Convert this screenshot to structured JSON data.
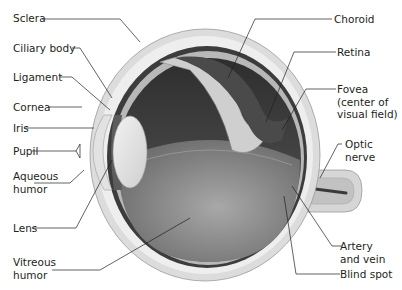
{
  "diagram": {
    "type": "anatomical cross-section",
    "colors": {
      "background": "#ffffff",
      "sclera_outer": "#d9d9d9",
      "sclera_inner": "#eeeeee",
      "choroid": "#3a3a3a",
      "retina": "#bdbdbd",
      "vitreous": "#8c8c8c",
      "lens": "#e6e6e6",
      "leader_line": "#231f20",
      "text": "#231f20"
    },
    "labels_left": [
      {
        "id": "sclera",
        "text": "Sclera"
      },
      {
        "id": "ciliary-body",
        "text": "Ciliary body"
      },
      {
        "id": "ligament",
        "text": "Ligament"
      },
      {
        "id": "cornea",
        "text": "Cornea"
      },
      {
        "id": "iris",
        "text": "Iris"
      },
      {
        "id": "pupil",
        "text": "Pupil"
      },
      {
        "id": "aqueous-humor",
        "text": "Aqueous\nhumor"
      },
      {
        "id": "lens",
        "text": "Lens"
      },
      {
        "id": "vitreous-humor",
        "text": "Vitreous\nhumor"
      }
    ],
    "labels_right": [
      {
        "id": "choroid",
        "text": "Choroid"
      },
      {
        "id": "retina",
        "text": "Retina"
      },
      {
        "id": "fovea",
        "text": "Fovea\n(center of\nvisual field)"
      },
      {
        "id": "optic-nerve",
        "text": "Optic\nnerve"
      },
      {
        "id": "artery-and-vein",
        "text": "Artery\nand vein"
      },
      {
        "id": "blind-spot",
        "text": "Blind spot"
      }
    ]
  }
}
